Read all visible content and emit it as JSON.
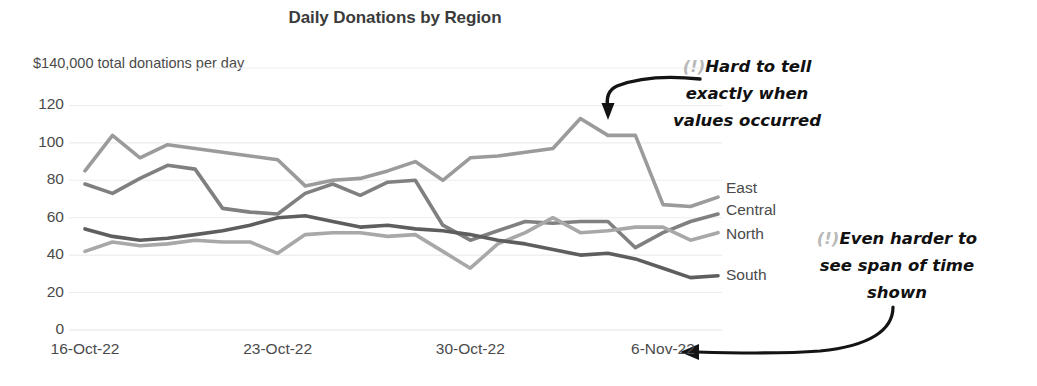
{
  "chart_data": {
    "type": "line",
    "title": "Daily Donations by Region",
    "subtitle": "$140,000 total donations per day",
    "xlabel": "",
    "ylabel": "",
    "ylim": [
      0,
      140
    ],
    "yticks": [
      0,
      20,
      40,
      60,
      80,
      100,
      120
    ],
    "ytick_labels": [
      "0",
      "20",
      "40",
      "60",
      "80",
      "100",
      "120"
    ],
    "xtick_labels": [
      "16-Oct-22",
      "23-Oct-22",
      "30-Oct-22",
      "6-Nov-22"
    ],
    "xtick_positions": [
      0,
      7,
      14,
      21
    ],
    "x_count": 24,
    "grid": true,
    "grid_axis": "y",
    "legend": "right-inline-labels",
    "series": [
      {
        "name": "East",
        "color": "#9b9b9b",
        "values": [
          85,
          104,
          92,
          99,
          97,
          95,
          93,
          91,
          77,
          80,
          81,
          85,
          90,
          80,
          92,
          93,
          95,
          97,
          113,
          104,
          104,
          67,
          66,
          71
        ]
      },
      {
        "name": "Central",
        "color": "#808080",
        "values": [
          78,
          73,
          81,
          88,
          86,
          65,
          63,
          62,
          73,
          78,
          72,
          79,
          80,
          56,
          48,
          53,
          58,
          57,
          58,
          58,
          44,
          52,
          58,
          62
        ]
      },
      {
        "name": "North",
        "color": "#a8a8a8",
        "values": [
          42,
          47,
          45,
          46,
          48,
          47,
          47,
          41,
          51,
          52,
          52,
          50,
          51,
          42,
          33,
          46,
          52,
          60,
          52,
          53,
          55,
          55,
          48,
          52
        ]
      },
      {
        "name": "South",
        "color": "#5e5e5e",
        "values": [
          54,
          50,
          48,
          49,
          51,
          53,
          56,
          60,
          61,
          58,
          55,
          56,
          54,
          53,
          51,
          48,
          46,
          43,
          40,
          41,
          38,
          33,
          28,
          29
        ]
      }
    ]
  },
  "annotations": [
    {
      "id": "annotation-when",
      "bang": "(!)",
      "text": "Hard to tell\nexactly when\nvalues occurred"
    },
    {
      "id": "annotation-span",
      "bang": "(!)",
      "text": "Even harder to\nsee span of time\nshown"
    }
  ],
  "colors": {
    "grid": "#ededed",
    "text": "#4a4a4a",
    "title": "#3b3b3b",
    "annotation": "#111111",
    "annotation_bang": "#b9b9b9",
    "background": "#ffffff"
  }
}
